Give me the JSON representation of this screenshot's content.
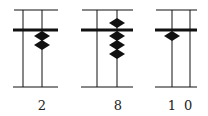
{
  "panels": [
    {
      "label": "2",
      "frame": {
        "x1": 14,
        "x2": 58
      },
      "rods": [
        {
          "x": 23,
          "beads_upper": 0,
          "beads_lower": 0
        },
        {
          "x": 42,
          "beads_upper": 0,
          "beads_lower": 2,
          "digit": "2"
        }
      ],
      "label_x": 42
    },
    {
      "label": "8",
      "frame": {
        "x1": 82,
        "x2": 133
      },
      "rods": [
        {
          "x": 97,
          "beads_upper": 0,
          "beads_lower": 0
        },
        {
          "x": 117,
          "beads_upper": 1,
          "beads_lower": 3,
          "digit": "8"
        }
      ],
      "label_x": 118
    },
    {
      "label": "1 0",
      "frame": {
        "x1": 156,
        "x2": 197
      },
      "rods": [
        {
          "x": 172,
          "beads_upper": 0,
          "beads_lower": 1,
          "digit": "1"
        },
        {
          "x": 190,
          "beads_upper": 0,
          "beads_lower": 0,
          "digit": "0"
        }
      ],
      "label_x": 181
    }
  ],
  "colors": {
    "ink": "#111111",
    "background": "#ffffff"
  }
}
